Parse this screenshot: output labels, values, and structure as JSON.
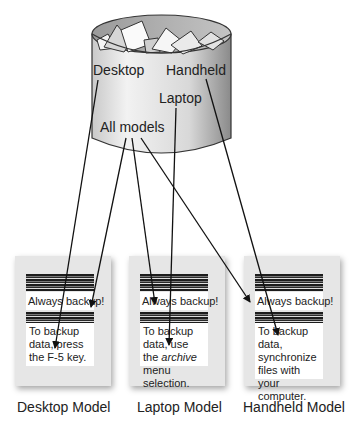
{
  "cylinder": {
    "labels": {
      "desktop": "Desktop",
      "handheld": "Handheld",
      "laptop": "Laptop",
      "all_models": "All models"
    }
  },
  "cards": [
    {
      "model": "Desktop Model",
      "common_text": "Always backup!",
      "specific_text_parts": [
        "To backup data, press the F-5 key."
      ]
    },
    {
      "model": "Laptop Model",
      "common_text": "Always backup!",
      "specific_pre": "To backup data, use the ",
      "specific_em": "archive",
      "specific_post": " menu selection."
    },
    {
      "model": "Handheld Model",
      "common_text": "Always backup!",
      "specific_text_parts": [
        "To backup data, synchronize files with your computer."
      ]
    }
  ],
  "arrows": [
    {
      "from": "All models",
      "to": "Desktop Model - Always backup!"
    },
    {
      "from": "Desktop",
      "to": "Desktop Model - specific text"
    },
    {
      "from": "All models",
      "to": "Laptop Model - Always backup!"
    },
    {
      "from": "Laptop",
      "to": "Laptop Model - specific text"
    },
    {
      "from": "All models",
      "to": "Handheld Model - Always backup!"
    },
    {
      "from": "Handheld",
      "to": "Handheld Model - specific text"
    }
  ]
}
